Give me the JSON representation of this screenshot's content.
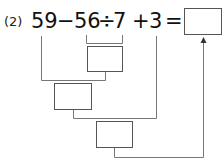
{
  "problem": {
    "label": "(2)",
    "tokens": {
      "a": "59",
      "minus": "−",
      "b": "56",
      "div": "÷",
      "c": "7",
      "plus": "+",
      "d": "3",
      "equals": "="
    },
    "answer_box": "",
    "boxes": {
      "step1": "",
      "step2": "",
      "step3": ""
    }
  },
  "colors": {
    "line": "#777777",
    "box_border": "#555555",
    "text": "#111111"
  }
}
